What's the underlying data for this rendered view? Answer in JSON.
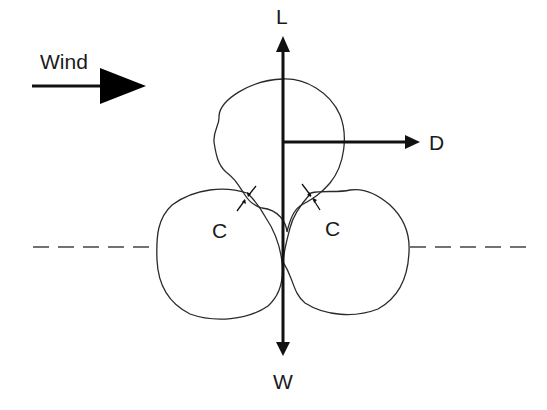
{
  "diagram": {
    "title": "",
    "labels": {
      "wind": "Wind",
      "lift": "L",
      "drag": "D",
      "weight": "W",
      "contact_left": "C",
      "contact_right": "C"
    },
    "colors": {
      "ink": "#111111",
      "background": "#ffffff"
    }
  }
}
